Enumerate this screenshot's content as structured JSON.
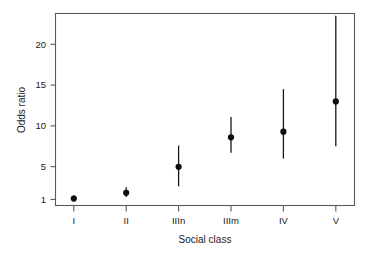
{
  "chart_data": {
    "type": "scatter",
    "title": "",
    "subtitle": "",
    "xlabel": "Social class",
    "ylabel": "Odds ratio",
    "categories": [
      "I",
      "II",
      "IIIn",
      "IIIm",
      "IV",
      "V"
    ],
    "values": [
      1.1,
      1.8,
      5.0,
      8.6,
      9.3,
      13.0
    ],
    "error_low": [
      0.8,
      1.3,
      2.6,
      6.7,
      6.0,
      7.5
    ],
    "error_high": [
      1.5,
      2.5,
      7.6,
      11.1,
      14.5,
      23.5
    ],
    "series": [
      {
        "name": "Odds ratio",
        "values": [
          1.1,
          1.8,
          5.0,
          8.6,
          9.3,
          13.0
        ],
        "ci_lower": [
          0.8,
          1.3,
          2.6,
          6.7,
          6.0,
          7.5
        ],
        "ci_upper": [
          1.5,
          2.5,
          7.6,
          11.1,
          14.5,
          23.5
        ]
      }
    ],
    "yticks": [
      1,
      5,
      10,
      15,
      20
    ],
    "yticklabels": [
      "1",
      "5",
      "10",
      "15",
      "20"
    ],
    "xticklabels": [
      "I",
      "II",
      "IIIn",
      "IIIm",
      "IV",
      "V"
    ],
    "ylim": [
      0,
      23.8
    ],
    "xlim": [
      0.4,
      6.6
    ],
    "grid": false,
    "legend": false,
    "legend_position": "none",
    "annotations": [],
    "marker": "filled-circle",
    "errorbar_style": "vertical-line"
  },
  "axes": {
    "y_axis_title": "Odds ratio",
    "x_axis_title": "Social class"
  },
  "colors": {
    "marker": "#0d0d0d",
    "errorbar": "#161616",
    "frame": "#5a5a5a",
    "background": "#ffffff",
    "text": "#1a1a1a"
  }
}
